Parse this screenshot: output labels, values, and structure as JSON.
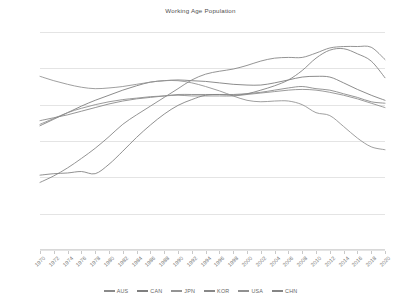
{
  "chart_data": {
    "type": "line",
    "title": "Working Age Population",
    "xlabel": "",
    "ylabel": "",
    "ylim": [
      45,
      75
    ],
    "ytick_step": 5,
    "ytick_labels": [
      "75.00",
      "70.00",
      "65.00",
      "60.00",
      "55.00",
      "50.00",
      "45.00"
    ],
    "ytick_values": [
      75,
      70,
      65,
      60,
      55,
      50,
      45
    ],
    "grid": true,
    "legend_position": "bottom",
    "x": [
      1970,
      1972,
      1974,
      1976,
      1978,
      1980,
      1982,
      1984,
      1986,
      1988,
      1990,
      1992,
      1994,
      1996,
      1998,
      2000,
      2002,
      2004,
      2006,
      2008,
      2010,
      2012,
      2014,
      2016,
      2018,
      2020
    ],
    "categories": [
      "1970",
      "1972",
      "1974",
      "1976",
      "1978",
      "1980",
      "1982",
      "1984",
      "1986",
      "1988",
      "1990",
      "1992",
      "1994",
      "1996",
      "1998",
      "2000",
      "2002",
      "2004",
      "2006",
      "2008",
      "2010",
      "2012",
      "2014",
      "2016",
      "2018",
      "2020"
    ],
    "series": [
      {
        "name": "AUS",
        "color": "#8a8a8a",
        "values": [
          62.8,
          63.2,
          63.6,
          64.1,
          64.6,
          65.1,
          65.5,
          65.8,
          66.0,
          66.2,
          66.4,
          66.4,
          66.4,
          66.4,
          66.4,
          66.5,
          66.7,
          67.0,
          67.3,
          67.5,
          67.2,
          67.0,
          66.5,
          66.0,
          65.4,
          65.2
        ]
      },
      {
        "name": "CAN",
        "color": "#7f7f7f",
        "values": [
          62.1,
          63.0,
          63.9,
          64.8,
          65.6,
          66.3,
          67.0,
          67.6,
          68.1,
          68.3,
          68.4,
          68.3,
          68.2,
          68.0,
          67.8,
          67.7,
          67.7,
          68.0,
          68.4,
          68.8,
          68.9,
          68.8,
          68.0,
          67.1,
          66.3,
          65.6
        ]
      },
      {
        "name": "JPN",
        "color": "#949494",
        "values": [
          68.9,
          68.3,
          67.8,
          67.4,
          67.2,
          67.3,
          67.5,
          67.8,
          68.1,
          68.3,
          68.3,
          68.0,
          67.5,
          66.9,
          66.2,
          65.6,
          65.4,
          65.5,
          65.5,
          65.0,
          63.9,
          63.5,
          62.0,
          60.4,
          59.2,
          58.8
        ]
      },
      {
        "name": "KOR",
        "color": "#888888",
        "values": [
          54.3,
          55.2,
          56.3,
          57.6,
          59.0,
          60.6,
          62.3,
          63.6,
          64.8,
          66.0,
          67.2,
          68.4,
          69.2,
          69.6,
          69.9,
          70.4,
          71.0,
          71.4,
          71.5,
          71.5,
          72.1,
          72.8,
          73.0,
          73.0,
          72.9,
          71.2
        ]
      },
      {
        "name": "USA",
        "color": "#909090",
        "values": [
          62.3,
          63.1,
          63.9,
          64.5,
          65.0,
          65.4,
          65.7,
          65.9,
          66.1,
          66.2,
          66.3,
          66.2,
          66.2,
          66.2,
          66.2,
          66.4,
          66.6,
          66.8,
          67.0,
          67.1,
          67.0,
          66.7,
          66.3,
          65.8,
          65.2,
          64.6
        ]
      },
      {
        "name": "CHN",
        "color": "#858585",
        "values": [
          55.3,
          55.5,
          55.6,
          55.8,
          55.5,
          56.8,
          58.6,
          60.5,
          62.2,
          63.7,
          64.9,
          65.7,
          66.3,
          66.4,
          66.3,
          66.5,
          67.0,
          67.6,
          68.4,
          69.7,
          71.4,
          72.5,
          72.7,
          72.0,
          71.0,
          68.7
        ]
      }
    ]
  },
  "legend": {
    "items": [
      {
        "label": "AUS"
      },
      {
        "label": "CAN"
      },
      {
        "label": "JPN"
      },
      {
        "label": "KOR"
      },
      {
        "label": "USA"
      },
      {
        "label": "CHN"
      }
    ]
  }
}
